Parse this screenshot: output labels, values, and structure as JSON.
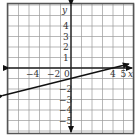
{
  "chart_data": {
    "type": "line",
    "title": "",
    "xlabel": "x",
    "ylabel": "y",
    "xlim": [
      -6,
      6
    ],
    "ylim": [
      -6,
      6
    ],
    "grid": true,
    "x_tick_labels": [
      "-4",
      "-2",
      "0",
      "4",
      "5"
    ],
    "y_tick_labels": [
      "4",
      "3",
      "2",
      "1",
      "2",
      "3",
      "4",
      "5"
    ],
    "series": [
      {
        "name": "line",
        "equation": "y = x/4 - 1",
        "slope": 0.25,
        "intercept": -1,
        "x": [
          -6.5,
          5.5
        ],
        "y": [
          -2.625,
          0.375
        ],
        "arrows_both_ends": true
      }
    ]
  },
  "labels": {
    "x_axis": "x",
    "y_axis": "y",
    "x_ticks": [
      {
        "value": -4,
        "text": "−4"
      },
      {
        "value": -2,
        "text": "−2"
      },
      {
        "value": 0,
        "text": "0"
      },
      {
        "value": 4,
        "text": "4"
      },
      {
        "value": 5,
        "text": "5"
      }
    ],
    "y_ticks": [
      {
        "value": 4,
        "text": "4"
      },
      {
        "value": 3,
        "text": "3"
      },
      {
        "value": 2,
        "text": "2"
      },
      {
        "value": 1,
        "text": "1"
      },
      {
        "value": -2,
        "text": "−2"
      },
      {
        "value": -3,
        "text": "−3"
      },
      {
        "value": -4,
        "text": "−4"
      },
      {
        "value": -5,
        "text": "−5"
      }
    ]
  },
  "colors": {
    "grid": "#9a9a9a",
    "frame": "#555555",
    "axis": "#222222",
    "line": "#111111"
  }
}
